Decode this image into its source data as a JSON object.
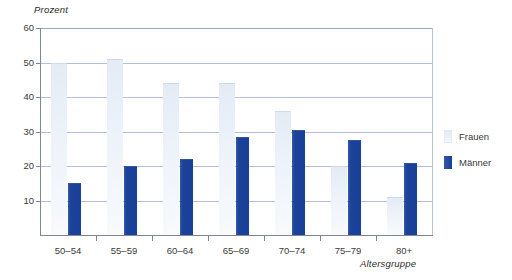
{
  "chart_data": {
    "type": "bar",
    "title": "",
    "subtitle": "",
    "xlabel": "Altersgruppe",
    "ylabel": "Prozent",
    "categories": [
      "50–54",
      "55–59",
      "60–64",
      "65–69",
      "70–74",
      "75–79",
      "80+"
    ],
    "series": [
      {
        "name": "Frauen",
        "color": "#eef3f9",
        "values": [
          50,
          51,
          44,
          44,
          36,
          20,
          11
        ]
      },
      {
        "name": "Männer",
        "color": "#1b4298",
        "values": [
          15,
          20,
          22,
          28.5,
          30.5,
          27.5,
          21
        ]
      }
    ],
    "ylim": [
      0,
      60
    ],
    "yticks": [
      10,
      20,
      30,
      40,
      50,
      60
    ],
    "ytick_labels": [
      "10",
      "20",
      "30",
      "40",
      "50",
      "60"
    ],
    "grid": true,
    "grid_axis": "y",
    "legend_position": "right",
    "legend": [
      "Frauen",
      "Männer"
    ]
  },
  "colors": {
    "bar_frauen": "#eef3f9",
    "bar_maenner": "#1b4298",
    "gridline": "#b3c0da",
    "axis": "#7d8790",
    "text": "#3a3a3a"
  }
}
